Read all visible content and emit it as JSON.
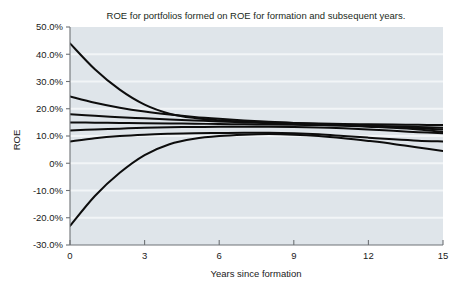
{
  "chart_data": {
    "type": "line",
    "title": "ROE for portfolios formed on ROE for formation and subsequent years.",
    "xlabel": "Years since formation",
    "ylabel": "ROE",
    "xlim": [
      0,
      15
    ],
    "ylim": [
      -30,
      50
    ],
    "grid": true,
    "legend": false,
    "xticks": [
      0,
      3,
      6,
      9,
      12,
      15
    ],
    "xtick_labels": [
      "0",
      "3",
      "6",
      "9",
      "12",
      "15"
    ],
    "yticks": [
      50,
      40,
      30,
      20,
      10,
      0,
      -10,
      -20,
      -30
    ],
    "ytick_labels": [
      "50.0%",
      "40.0%",
      "30.0%",
      "20.0%",
      "10.0%",
      "0%",
      "-10.0%",
      "-20.0%",
      "-30.0%"
    ],
    "x": [
      0,
      1,
      2,
      3,
      4,
      5,
      6,
      7,
      8,
      9,
      10,
      11,
      12,
      13,
      14,
      15
    ],
    "series": [
      {
        "name": "Portfolio 1 (highest formation ROE)",
        "values": [
          44.0,
          34.5,
          27.0,
          21.5,
          18.2,
          16.6,
          15.8,
          15.3,
          15.0,
          14.8,
          14.6,
          14.4,
          14.3,
          14.2,
          14.1,
          14.0
        ]
      },
      {
        "name": "Portfolio 2",
        "values": [
          24.5,
          22.2,
          20.4,
          19.0,
          17.9,
          17.0,
          16.3,
          15.7,
          15.2,
          14.8,
          14.4,
          14.0,
          13.6,
          13.2,
          12.8,
          12.4
        ]
      },
      {
        "name": "Portfolio 3",
        "values": [
          18.0,
          17.4,
          16.9,
          16.5,
          16.1,
          15.7,
          15.3,
          15.0,
          14.7,
          14.4,
          14.1,
          13.8,
          13.4,
          13.0,
          12.4,
          11.5
        ]
      },
      {
        "name": "Portfolio 4 (median)",
        "values": [
          15.0,
          14.9,
          14.8,
          14.7,
          14.6,
          14.5,
          14.4,
          14.3,
          14.2,
          14.1,
          14.0,
          13.9,
          13.8,
          13.6,
          13.3,
          13.0
        ]
      },
      {
        "name": "Portfolio 5",
        "values": [
          12.0,
          12.4,
          12.7,
          13.0,
          13.2,
          13.3,
          13.4,
          13.4,
          13.4,
          13.3,
          13.1,
          12.8,
          12.4,
          11.9,
          11.4,
          11.0
        ]
      },
      {
        "name": "Portfolio 6",
        "values": [
          8.0,
          9.2,
          10.0,
          10.5,
          10.8,
          11.0,
          11.1,
          11.2,
          11.2,
          11.0,
          10.6,
          10.0,
          9.4,
          8.8,
          8.3,
          8.0
        ]
      },
      {
        "name": "Portfolio 7 (lowest formation ROE)",
        "values": [
          -23.0,
          -12.0,
          -3.5,
          3.0,
          7.0,
          9.0,
          10.0,
          10.5,
          10.7,
          10.5,
          10.0,
          9.2,
          8.2,
          7.1,
          5.8,
          4.5
        ]
      }
    ]
  },
  "style": {
    "plot_background": "#dfe5ea",
    "gridline_color": "#f2f5f7",
    "axis_color": "#6e7276",
    "line_color": "#0d0d0d",
    "page_background": "#ffffff"
  }
}
